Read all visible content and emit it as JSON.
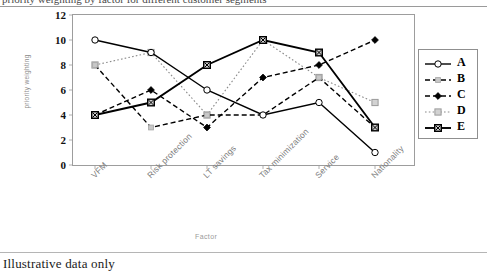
{
  "page": {
    "clipped_heading": "priority weighting by factor for different customer segments",
    "caption": "Illustrative data only"
  },
  "chart_data": {
    "type": "line",
    "title": "",
    "xlabel": "Factor",
    "ylabel": "priority weighting",
    "categories": [
      "VFM",
      "Risk protection",
      "LT savings",
      "Tax minimization",
      "Service",
      "Nationality"
    ],
    "ylim": [
      0,
      12
    ],
    "yticks": [
      0,
      2,
      4,
      6,
      8,
      10,
      12
    ],
    "grid": false,
    "legend_position": "right",
    "series": [
      {
        "name": "A",
        "values": [
          10,
          9,
          6,
          4,
          5,
          1
        ],
        "color": "#000000",
        "line": "solid",
        "marker": "open-circle"
      },
      {
        "name": "B",
        "values": [
          8,
          3,
          4,
          4,
          7,
          3
        ],
        "color": "#000000",
        "line": "dashed",
        "marker": "small-gray-square"
      },
      {
        "name": "C",
        "values": [
          4,
          6,
          3,
          7,
          8,
          10
        ],
        "color": "#000000",
        "line": "dashed",
        "marker": "filled-diamond"
      },
      {
        "name": "D",
        "values": [
          8,
          9,
          4,
          10,
          7,
          5
        ],
        "color": "#8a8a8a",
        "line": "dotted",
        "marker": "gray-square"
      },
      {
        "name": "E",
        "values": [
          4,
          5,
          8,
          10,
          9,
          3
        ],
        "color": "#000000",
        "line": "solid",
        "marker": "dark-square"
      }
    ]
  },
  "legend": {
    "entries": [
      {
        "label": "A"
      },
      {
        "label": "B"
      },
      {
        "label": "C"
      },
      {
        "label": "D"
      },
      {
        "label": "E"
      }
    ]
  }
}
